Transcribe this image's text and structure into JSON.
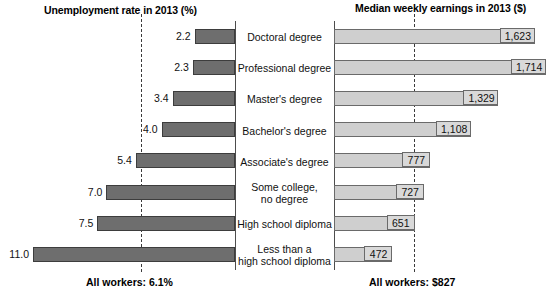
{
  "chart_data": {
    "type": "bar",
    "left": {
      "title": "Unemployment rate in 2013 (%)",
      "unit": "%",
      "axis_side": "right",
      "mean_label": "All workers: 6.1%",
      "mean_value": 6.1,
      "xlim": [
        0,
        11.0
      ],
      "grid": false,
      "bar_color": "#6e6e6e",
      "values": [
        2.2,
        2.3,
        3.4,
        4.0,
        5.4,
        7.0,
        7.5,
        11.0
      ],
      "value_labels": [
        "2.2",
        "2.3",
        "3.4",
        "4.0",
        "5.4",
        "7.0",
        "7.5",
        "11.0"
      ]
    },
    "right": {
      "title": "Median weekly earnings in 2013 ($)",
      "unit": "$",
      "axis_side": "left",
      "mean_label": "All workers: $827",
      "mean_value": 827,
      "xlim": [
        0,
        1714
      ],
      "grid": false,
      "bar_color": "#cfcfcf",
      "values": [
        1623,
        1714,
        1329,
        1108,
        777,
        727,
        651,
        472
      ],
      "value_labels": [
        "1,623",
        "1,714",
        "1,329",
        "1,108",
        "777",
        "727",
        "651",
        "472"
      ]
    },
    "categories": [
      "Doctoral degree",
      "Professional degree",
      "Master's degree",
      "Bachelor's degree",
      "Associate's degree",
      "Some college,\nno degree",
      "High school diploma",
      "Less than a\nhigh school diploma"
    ],
    "legend": null,
    "legend_position": "none"
  },
  "headers": {
    "left": "Unemployment rate in 2013 (%)",
    "right": "Median weekly earnings in 2013 ($)"
  },
  "footers": {
    "left": "All workers: 6.1%",
    "right": "All workers: $827"
  },
  "rows": [
    {
      "category_line1": "Doctoral degree",
      "category_line2": "",
      "left_label": "2.2",
      "right_label": "1,623"
    },
    {
      "category_line1": "Professional degree",
      "category_line2": "",
      "left_label": "2.3",
      "right_label": "1,714"
    },
    {
      "category_line1": "Master's degree",
      "category_line2": "",
      "left_label": "3.4",
      "right_label": "1,329"
    },
    {
      "category_line1": "Bachelor's degree",
      "category_line2": "",
      "left_label": "4.0",
      "right_label": "1,108"
    },
    {
      "category_line1": "Associate's degree",
      "category_line2": "",
      "left_label": "5.4",
      "right_label": "777"
    },
    {
      "category_line1": "Some college,",
      "category_line2": "no degree",
      "left_label": "7.0",
      "right_label": "727"
    },
    {
      "category_line1": "High school diploma",
      "category_line2": "",
      "left_label": "7.5",
      "right_label": "651"
    },
    {
      "category_line1": "Less than a",
      "category_line2": "high school diploma",
      "left_label": "11.0",
      "right_label": "472"
    }
  ]
}
